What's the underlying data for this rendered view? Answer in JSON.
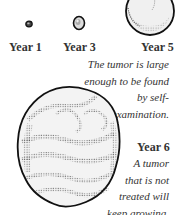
{
  "stages": [
    {
      "label": "Year 1"
    },
    {
      "label": "Year 3"
    },
    {
      "label": "Year 5"
    },
    {
      "label": "Year 6"
    }
  ],
  "captions": {
    "year5": [
      "The tumor is  large",
      "enough to be found",
      "by self-",
      "examination."
    ],
    "year6": [
      "A tumor",
      "that is not",
      "treated will",
      "keep growing."
    ]
  },
  "colors": {
    "outline": "#1a1a1a",
    "fill": "#f2f2f2",
    "stipple": "#555555"
  }
}
